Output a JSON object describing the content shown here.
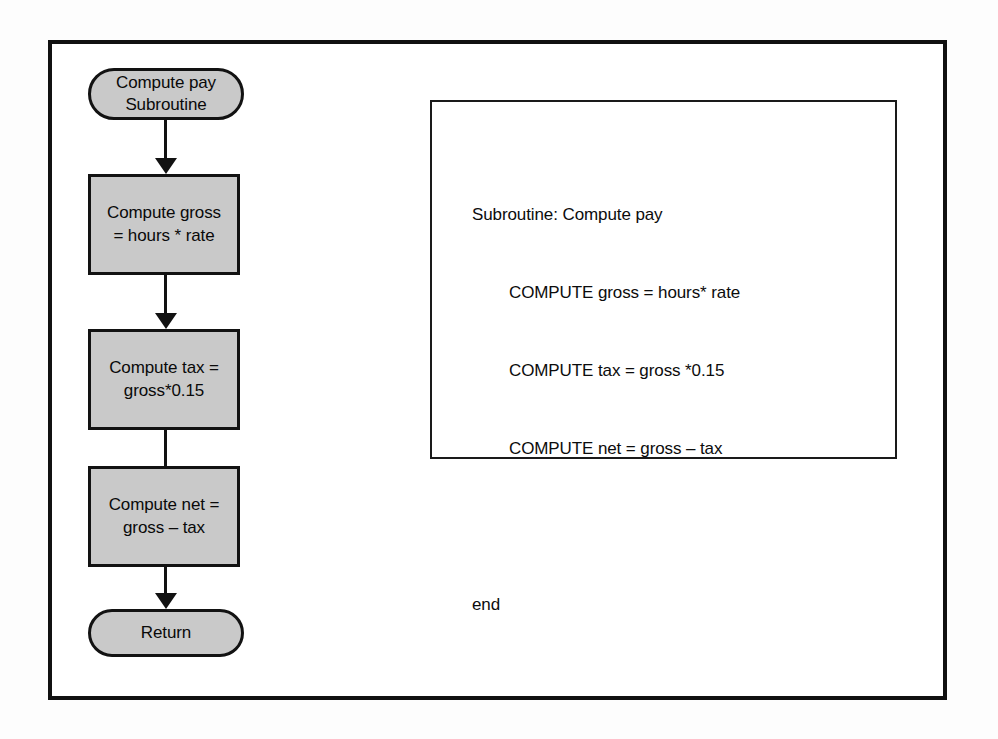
{
  "diagram": {
    "fill_color": "#c9c9c9",
    "line_color": "#121212",
    "frame_color": "#111111",
    "background_color": "#ffffff"
  },
  "flowchart": {
    "nodes": [
      {
        "id": "start-terminator",
        "shape": "terminator",
        "label": "Compute pay\nSubroutine"
      },
      {
        "id": "compute-gross",
        "shape": "process",
        "label": "Compute gross\n= hours * rate"
      },
      {
        "id": "compute-tax",
        "shape": "process",
        "label": "Compute tax =\ngross*0.15"
      },
      {
        "id": "compute-net",
        "shape": "process",
        "label": "Compute net =\ngross – tax"
      },
      {
        "id": "return-terminator",
        "shape": "terminator",
        "label": "Return"
      }
    ]
  },
  "pseudocode": {
    "lines": [
      "Subroutine: Compute pay",
      "        COMPUTE gross = hours* rate",
      "        COMPUTE tax = gross *0.15",
      "        COMPUTE net = gross – tax",
      "",
      "end"
    ]
  }
}
